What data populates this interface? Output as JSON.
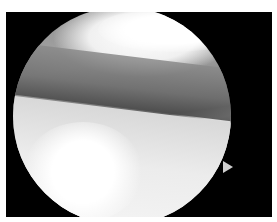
{
  "image": {
    "description": "Grayscale arthroscopic view: circular endoscope field of view inside a black rectangular frame, showing joint surfaces with a bright lower region and a darker tissue band across the middle; small orientation notch on right edge of circle",
    "colors": {
      "frame": "#000000",
      "background": "#ffffff",
      "tissue_dark": "#5c5c5c",
      "tissue_light": "#f0f0f0"
    }
  }
}
